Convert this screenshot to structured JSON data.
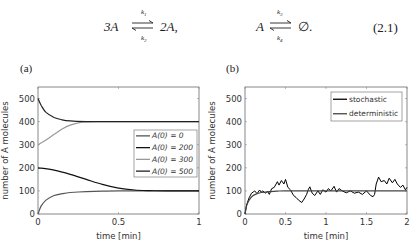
{
  "equation": {
    "left": {
      "reactant": "3A",
      "product": "2A,",
      "k_forward": "k1",
      "k_backward": "k2",
      "k_forward_display": "k",
      "k_forward_sub": "1",
      "k_backward_display": "k",
      "k_backward_sub": "2"
    },
    "right": {
      "reactant": "A",
      "product": "∅.",
      "k_forward_display": "k",
      "k_forward_sub": "3",
      "k_backward_display": "k",
      "k_backward_sub": "4"
    },
    "number": "(2.1)"
  },
  "chart_data": [
    {
      "panel": "(a)",
      "type": "line",
      "xlabel": "time [min]",
      "ylabel": "number of A molecules",
      "xlim": [
        0,
        1
      ],
      "ylim": [
        0,
        550
      ],
      "xticks": [
        0,
        0.5,
        1
      ],
      "xtick_labels": [
        "0",
        "0.5",
        "1"
      ],
      "yticks": [
        0,
        100,
        200,
        300,
        400,
        500
      ],
      "ytick_labels": [
        "0",
        "100",
        "200",
        "300",
        "400",
        "500"
      ],
      "grid": false,
      "legend_position": "center right",
      "series": [
        {
          "name": "A(0) = 0",
          "color": "#555555",
          "x": [
            0,
            0.02,
            0.05,
            0.1,
            0.15,
            0.2,
            0.3,
            0.4,
            0.5,
            0.7,
            1.0
          ],
          "values": [
            0,
            35,
            60,
            80,
            88,
            93,
            97,
            99,
            100,
            100,
            100
          ]
        },
        {
          "name": "A(0) = 200",
          "color": "#111111",
          "x": [
            0,
            0.1,
            0.2,
            0.3,
            0.4,
            0.5,
            0.6,
            0.7,
            0.8,
            1.0
          ],
          "values": [
            200,
            190,
            172,
            150,
            128,
            112,
            104,
            101,
            100,
            100
          ]
        },
        {
          "name": "A(0) = 300",
          "color": "#999999",
          "x": [
            0,
            0.05,
            0.1,
            0.15,
            0.2,
            0.25,
            0.3,
            0.4,
            0.5,
            1.0
          ],
          "values": [
            300,
            320,
            345,
            368,
            385,
            395,
            399,
            400,
            400,
            400
          ]
        },
        {
          "name": "A(0) = 500",
          "color": "#222222",
          "x": [
            0,
            0.02,
            0.05,
            0.1,
            0.15,
            0.2,
            0.3,
            0.4,
            0.5,
            1.0
          ],
          "values": [
            500,
            470,
            440,
            418,
            408,
            403,
            400,
            400,
            400,
            400
          ]
        }
      ]
    },
    {
      "panel": "(b)",
      "type": "line",
      "xlabel": "time [min]",
      "ylabel": "number of A molecules",
      "xlim": [
        0,
        2
      ],
      "ylim": [
        0,
        550
      ],
      "xticks": [
        0,
        0.5,
        1,
        1.5,
        2
      ],
      "xtick_labels": [
        "0",
        "0.5",
        "1",
        "1.5",
        "2"
      ],
      "yticks": [
        0,
        100,
        200,
        300,
        400,
        500
      ],
      "ytick_labels": [
        "0",
        "100",
        "200",
        "300",
        "400",
        "500"
      ],
      "grid": false,
      "legend_position": "upper right",
      "series": [
        {
          "name": "stochastic",
          "color": "#000000",
          "x": [
            0,
            0.02,
            0.05,
            0.08,
            0.1,
            0.12,
            0.15,
            0.18,
            0.2,
            0.22,
            0.25,
            0.28,
            0.3,
            0.33,
            0.36,
            0.4,
            0.42,
            0.45,
            0.48,
            0.5,
            0.53,
            0.56,
            0.6,
            0.63,
            0.66,
            0.7,
            0.73,
            0.76,
            0.78,
            0.8,
            0.83,
            0.86,
            0.9,
            0.93,
            0.96,
            1.0,
            1.03,
            1.06,
            1.1,
            1.13,
            1.16,
            1.2,
            1.25,
            1.3,
            1.35,
            1.4,
            1.45,
            1.5,
            1.55,
            1.58,
            1.6,
            1.62,
            1.65,
            1.68,
            1.72,
            1.75,
            1.78,
            1.82,
            1.85,
            1.88,
            1.92,
            1.95,
            1.98,
            2.0
          ],
          "values": [
            0,
            40,
            70,
            90,
            95,
            100,
            88,
            104,
            95,
            100,
            90,
            98,
            85,
            110,
            115,
            140,
            125,
            145,
            130,
            150,
            115,
            105,
            80,
            72,
            60,
            50,
            65,
            85,
            105,
            118,
            90,
            80,
            100,
            85,
            105,
            95,
            110,
            100,
            120,
            95,
            110,
            100,
            92,
            100,
            90,
            95,
            85,
            100,
            80,
            75,
            85,
            130,
            160,
            140,
            145,
            130,
            155,
            135,
            150,
            130,
            115,
            125,
            105,
            115
          ]
        },
        {
          "name": "deterministic",
          "color": "#444444",
          "x": [
            0,
            0.02,
            0.05,
            0.1,
            0.15,
            0.2,
            0.3,
            0.4,
            0.5,
            1.0,
            2.0
          ],
          "values": [
            0,
            35,
            60,
            80,
            88,
            93,
            97,
            99,
            100,
            100,
            100
          ]
        }
      ]
    }
  ]
}
